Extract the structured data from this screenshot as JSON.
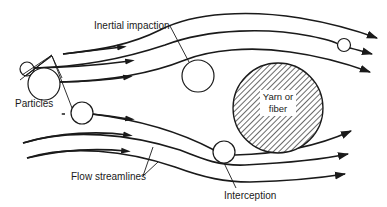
{
  "diagram": {
    "labels": {
      "inertial_impaction": "Inertial impaction",
      "particles": "Particles",
      "fiber_line1": "Yarn or",
      "fiber_line2": "fiber",
      "flow_streamlines": "Flow streamlines",
      "interception": "Interception"
    },
    "elements": {
      "fiber": {
        "shape": "circle",
        "fill": "hatched",
        "label": "Yarn or fiber"
      },
      "particles_count": 6,
      "streamlines_count": 6
    },
    "colors": {
      "line": "#1a1a1a",
      "background": "#ffffff"
    }
  }
}
